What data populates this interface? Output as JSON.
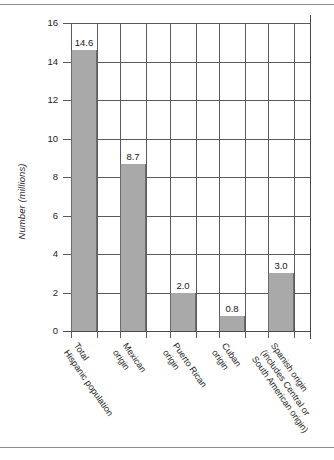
{
  "figure": {
    "name": "hispanic-population-bar-chart",
    "background_color": "#ffffff",
    "bar_color": "#a9a9a9",
    "grid_color": "#5a5a5a",
    "text_color": "#1d1d1d"
  },
  "chart_data": {
    "type": "bar",
    "title": "",
    "subtitle": "",
    "xlabel": "",
    "ylabel": "Number (millions)",
    "ylim": [
      0,
      16
    ],
    "ytick_step": 2,
    "yticks": [
      "16",
      "14",
      "12",
      "10",
      "8",
      "6",
      "4",
      "2",
      "0"
    ],
    "grid": "both",
    "legend": "none",
    "categories": [
      "Total Hispanic population",
      "Mexican origin",
      "Puerto Rican origin",
      "Cuban origin",
      "Spanish origin (includes Central or South American origin)"
    ],
    "category_lines": [
      [
        "Total",
        "Hispanic population"
      ],
      [
        "Mexican",
        "origin"
      ],
      [
        "Puerto Rican",
        "origin"
      ],
      [
        "Cuban",
        "origin"
      ],
      [
        "Spanish origin",
        "(includes Central or",
        "South American origin)"
      ]
    ],
    "values": [
      14.6,
      8.7,
      2.0,
      0.8,
      3.0
    ],
    "value_labels": [
      "14.6",
      "8.7",
      "2.0",
      "0.8",
      "3.0"
    ]
  }
}
